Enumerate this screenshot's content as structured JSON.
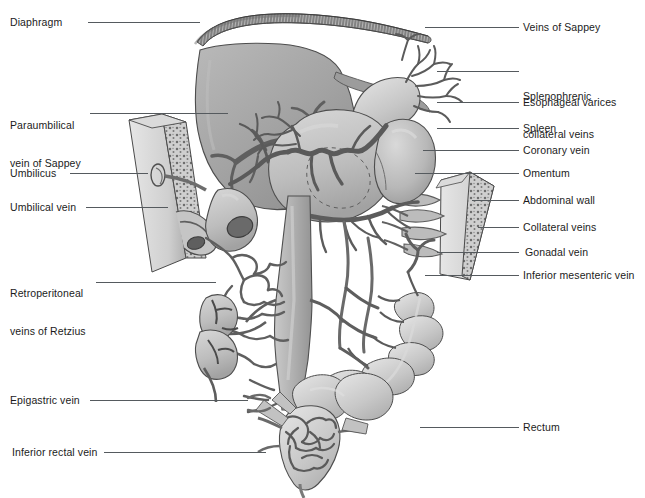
{
  "figure": {
    "type": "medical-anatomy-illustration",
    "palette": {
      "background": "#ffffff",
      "text": "#1b1b1b",
      "leader_line": "#555a5e",
      "organ_light": "#d3d3d3",
      "organ_mid": "#b4b4b4",
      "organ_dark": "#8e8e8e",
      "liver_fill": "#a8a8a8",
      "vessel_stroke": "#6d6d6d",
      "vessel_dark": "#5a5a5a",
      "outline": "#4a4a4a"
    }
  },
  "labels": {
    "left": [
      {
        "id": "diaphragm",
        "text": "Diaphragm",
        "lines": [
          "Diaphragm"
        ],
        "x": 10,
        "y": 16,
        "leader": {
          "x": 88,
          "y": 22,
          "length": 112
        }
      },
      {
        "id": "paraumbilical-vein-of-sappey",
        "text": "Paraumbilical vein of Sappey",
        "lines": [
          "Paraumbilical",
          "vein of Sappey"
        ],
        "x": 10,
        "y": 94,
        "leader": {
          "x": 90,
          "y": 113,
          "length": 138
        }
      },
      {
        "id": "umbilicus",
        "text": "Umbilicus",
        "lines": [
          "Umbilicus"
        ],
        "x": 10,
        "y": 167,
        "leader": {
          "x": 70,
          "y": 173,
          "length": 78
        }
      },
      {
        "id": "umbilical-vein",
        "text": "Umbilical vein",
        "lines": [
          "Umbilical vein"
        ],
        "x": 10,
        "y": 201,
        "leader": {
          "x": 86,
          "y": 207,
          "length": 82
        }
      },
      {
        "id": "retroperitoneal-veins-of-retzius",
        "text": "Retroperitoneal veins of Retzius",
        "lines": [
          "Retroperitoneal",
          "veins of Retzius"
        ],
        "x": 10,
        "y": 262,
        "leader": {
          "x": 96,
          "y": 282,
          "length": 120
        }
      },
      {
        "id": "epigastric-vein",
        "text": "Epigastric vein",
        "lines": [
          "Epigastric vein"
        ],
        "x": 10,
        "y": 394,
        "leader": {
          "x": 90,
          "y": 400,
          "length": 158
        }
      },
      {
        "id": "inferior-rectal-vein",
        "text": "Inferior rectal vein",
        "lines": [
          "Inferior rectal vein"
        ],
        "x": 12,
        "y": 446,
        "leader": {
          "x": 104,
          "y": 452,
          "length": 162
        }
      }
    ],
    "right": [
      {
        "id": "veins-of-sappey",
        "text": "Veins of Sappey",
        "lines": [
          "Veins of Sappey"
        ],
        "x": 523,
        "y": 21,
        "leader": {
          "x": 425,
          "y": 27,
          "length": 94
        }
      },
      {
        "id": "splenophrenic-collateral-veins",
        "text": "Splenophrenic collateral veins",
        "lines": [
          "Splenophrenic",
          "collateral veins"
        ],
        "x": 523,
        "y": 65,
        "leader": {
          "x": 437,
          "y": 71,
          "length": 82
        }
      },
      {
        "id": "esophageal-varices",
        "text": "Esophageal varices",
        "lines": [
          "Esophageal varices"
        ],
        "x": 523,
        "y": 96,
        "leader": {
          "x": 437,
          "y": 102,
          "length": 82
        }
      },
      {
        "id": "spleen",
        "text": "Spleen",
        "lines": [
          "Spleen"
        ],
        "x": 523,
        "y": 122,
        "leader": {
          "x": 437,
          "y": 128,
          "length": 82
        }
      },
      {
        "id": "coronary-vein",
        "text": "Coronary vein",
        "lines": [
          "Coronary vein"
        ],
        "x": 523,
        "y": 144,
        "leader": {
          "x": 423,
          "y": 150,
          "length": 96
        }
      },
      {
        "id": "omentum",
        "text": "Omentum",
        "lines": [
          "Omentum"
        ],
        "x": 523,
        "y": 167,
        "leader": {
          "x": 415,
          "y": 173,
          "length": 104
        }
      },
      {
        "id": "abdominal-wall",
        "text": "Abdominal wall",
        "lines": [
          "Abdominal wall"
        ],
        "x": 523,
        "y": 194,
        "leader": {
          "x": 472,
          "y": 200,
          "length": 47
        }
      },
      {
        "id": "collateral-veins",
        "text": "Collateral veins",
        "lines": [
          "Collateral veins"
        ],
        "x": 523,
        "y": 221,
        "leader": {
          "x": 478,
          "y": 227,
          "length": 41
        }
      },
      {
        "id": "gonadal-vein",
        "text": "Gonadal vein",
        "lines": [
          "Gonadal vein"
        ],
        "x": 525,
        "y": 246,
        "leader": {
          "x": 437,
          "y": 252,
          "length": 82
        }
      },
      {
        "id": "inferior-mesenteric-vein",
        "text": "Inferior mesenteric vein",
        "lines": [
          "Inferior mesenteric vein"
        ],
        "x": 523,
        "y": 269,
        "leader": {
          "x": 425,
          "y": 275,
          "length": 94
        }
      },
      {
        "id": "rectum",
        "text": "Rectum",
        "lines": [
          "Rectum"
        ],
        "x": 523,
        "y": 421,
        "leader": {
          "x": 420,
          "y": 427,
          "length": 99
        }
      }
    ]
  },
  "structures": [
    {
      "id": "diaphragm",
      "name": "Diaphragm",
      "description": "striated arched muscular band across the top of the liver"
    },
    {
      "id": "liver",
      "name": "Liver",
      "description": "large shaded mass occupying upper-left of the abdomen"
    },
    {
      "id": "stomach",
      "name": "Stomach",
      "description": "central organ with coronary vein branching over lesser curvature"
    },
    {
      "id": "esophagus",
      "name": "Esophagus with varices",
      "description": "tubular structure superior to stomach with dilated varices"
    },
    {
      "id": "spleen",
      "name": "Spleen",
      "description": "ovoid organ right of stomach with splenophrenic collaterals"
    },
    {
      "id": "duodenum",
      "name": "Duodenum",
      "description": "C-shaped loop below liver with dark lumen"
    },
    {
      "id": "abdominal-wall-left",
      "name": "Left abdominal wall flap",
      "description": "tapered wall segment containing umbilicus and umbilical vein"
    },
    {
      "id": "abdominal-wall-right",
      "name": "Right abdominal wall flap",
      "description": "tapered wall segment with collateral veins"
    },
    {
      "id": "kidney",
      "name": "Kidney",
      "description": "bean-shaped organ lower-left with retroperitoneal veins"
    },
    {
      "id": "colon",
      "name": "Colon",
      "description": "haustrated bowel loops lower-right and inferiorly"
    },
    {
      "id": "ivc",
      "name": "Inferior vena cava",
      "description": "vertical central vessel descending to the pelvis"
    },
    {
      "id": "rectum",
      "name": "Rectum",
      "description": "terminal bowel with hemorrhoidal venous plexus"
    }
  ]
}
